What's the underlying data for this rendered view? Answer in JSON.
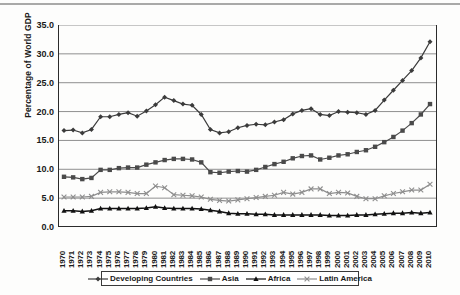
{
  "chart_data": {
    "type": "line",
    "title": "",
    "xlabel": "",
    "ylabel": "Percentage of World GDP",
    "ylim": [
      0,
      35
    ],
    "ytick_step": 5,
    "yticks": [
      "0.0",
      "5.0",
      "10.0",
      "15.0",
      "20.0",
      "25.0",
      "30.0",
      "35.0"
    ],
    "grid": "horizontal",
    "legend_position": "bottom",
    "categories": [
      "1970",
      "1971",
      "1972",
      "1973",
      "1974",
      "1975",
      "1976",
      "1977",
      "1978",
      "1979",
      "1980",
      "1981",
      "1982",
      "1983",
      "1984",
      "1985",
      "1986",
      "1987",
      "1988",
      "1989",
      "1990",
      "1991",
      "1992",
      "1993",
      "1994",
      "1995",
      "1996",
      "1997",
      "1998",
      "1999",
      "2000",
      "2001",
      "2002",
      "2003",
      "2004",
      "2005",
      "2006",
      "2007",
      "2008",
      "2009",
      "2010"
    ],
    "series": [
      {
        "name": "Developing Countries",
        "marker": "diamond",
        "color": "#3b3b3b",
        "values": [
          16.7,
          16.8,
          16.3,
          16.9,
          19.1,
          19.1,
          19.5,
          19.8,
          19.2,
          20.1,
          21.2,
          22.5,
          21.9,
          21.3,
          21.1,
          19.5,
          16.9,
          16.3,
          16.5,
          17.2,
          17.6,
          17.8,
          17.7,
          18.2,
          18.6,
          19.6,
          20.2,
          20.5,
          19.5,
          19.3,
          20.0,
          19.9,
          19.8,
          19.5,
          20.2,
          22.0,
          23.7,
          25.4,
          27.1,
          29.3,
          32.1
        ]
      },
      {
        "name": "Asia",
        "marker": "square",
        "color": "#4a4a4a",
        "values": [
          8.7,
          8.6,
          8.3,
          8.5,
          9.9,
          9.9,
          10.2,
          10.3,
          10.3,
          10.8,
          11.2,
          11.6,
          11.8,
          11.8,
          11.7,
          11.2,
          9.5,
          9.4,
          9.6,
          9.7,
          9.6,
          9.9,
          10.4,
          10.9,
          11.3,
          11.9,
          12.3,
          12.4,
          11.7,
          12.0,
          12.4,
          12.6,
          13.0,
          13.3,
          13.9,
          14.7,
          15.6,
          16.7,
          18.0,
          19.5,
          21.3
        ]
      },
      {
        "name": "Africa",
        "marker": "triangle",
        "color": "#111111",
        "values": [
          2.8,
          2.8,
          2.7,
          2.8,
          3.2,
          3.2,
          3.2,
          3.2,
          3.2,
          3.3,
          3.5,
          3.3,
          3.2,
          3.2,
          3.2,
          3.1,
          2.9,
          2.7,
          2.4,
          2.3,
          2.3,
          2.2,
          2.2,
          2.1,
          2.1,
          2.1,
          2.1,
          2.1,
          2.1,
          2.0,
          2.0,
          2.0,
          2.1,
          2.1,
          2.2,
          2.3,
          2.4,
          2.4,
          2.5,
          2.4,
          2.5
        ]
      },
      {
        "name": "Latin America",
        "marker": "x",
        "color": "#8e8e8e",
        "values": [
          5.2,
          5.2,
          5.2,
          5.3,
          6.0,
          6.1,
          6.1,
          6.0,
          5.8,
          5.8,
          7.1,
          6.8,
          5.6,
          5.5,
          5.4,
          5.2,
          4.8,
          4.6,
          4.5,
          4.7,
          4.9,
          5.1,
          5.3,
          5.5,
          6.0,
          5.7,
          6.0,
          6.6,
          6.6,
          5.8,
          6.0,
          5.9,
          5.3,
          4.9,
          4.9,
          5.4,
          5.8,
          6.1,
          6.4,
          6.4,
          7.4
        ]
      }
    ]
  }
}
